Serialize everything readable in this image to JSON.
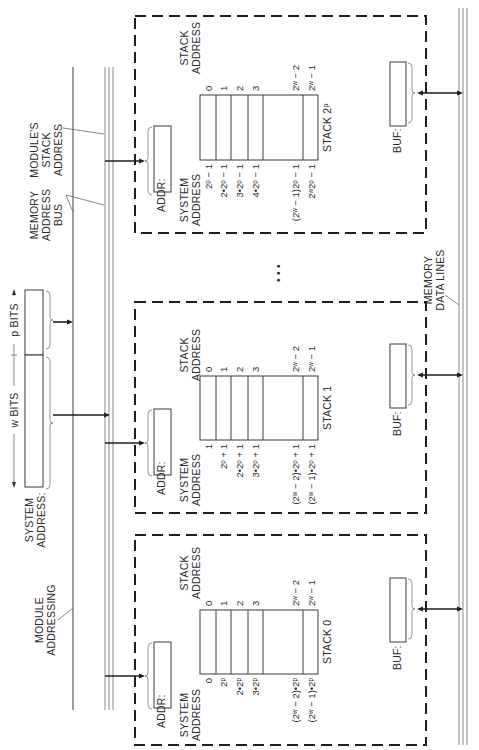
{
  "figure": {
    "orientation": "rotated 90 degrees counter-clockwise",
    "labels": {
      "module_addressing": [
        "MODULE",
        "ADDRESSING"
      ],
      "system_address": [
        "SYSTEM",
        "ADDRESS:"
      ],
      "w_bits": "w BITS",
      "p_bits": "p BITS",
      "memory_address_bus": [
        "MEMORY",
        "ADDRESS",
        "BUS"
      ],
      "modules_stack_address": [
        "MODULE'S",
        "STACK",
        "ADDRESS"
      ],
      "memory_data_lines": [
        "MEMORY",
        "DATA LINES"
      ],
      "ellipsis": "• • •"
    },
    "modules": [
      {
        "name": "STACK 0",
        "addr_label": "ADDR:",
        "buf_label": "BUF:",
        "system_address_heading": [
          "SYSTEM",
          "ADDRESS"
        ],
        "stack_address_heading": [
          "STACK",
          "ADDRESS"
        ],
        "stack_addresses": [
          "0",
          "1",
          "2",
          "3",
          "2ʷ − 2",
          "2ʷ − 1"
        ],
        "system_addresses": [
          "0",
          "2ᵖ",
          "2•2ᵖ",
          "3•2ᵖ",
          "(2ʷ − 2)•2ᵖ",
          "(2ʷ − 1)•2ᵖ"
        ]
      },
      {
        "name": "STACK 1",
        "addr_label": "ADDR:",
        "buf_label": "BUF:",
        "system_address_heading": [
          "SYSTEM",
          "ADDRESS"
        ],
        "stack_address_heading": [
          "STACK",
          "ADDRESS"
        ],
        "stack_addresses": [
          "0",
          "1",
          "2",
          "3",
          "2ʷ − 2",
          "2ʷ − 1"
        ],
        "system_addresses": [
          "1",
          "2ᵖ + 1",
          "2•2ᵖ + 1",
          "3•2ᵖ + 1",
          "(2ʷ − 2)•2ᵖ + 1",
          "(2ʷ − 1)•2ᵖ + 1"
        ]
      },
      {
        "name": "STACK 2ᵖ",
        "addr_label": "ADDR:",
        "buf_label": "BUF:",
        "system_address_heading": [
          "SYSTEM",
          "ADDRESS"
        ],
        "stack_address_heading": [
          "STACK",
          "ADDRESS"
        ],
        "stack_addresses": [
          "0",
          "1",
          "2",
          "3",
          "2ʷ − 2",
          "2ʷ − 1"
        ],
        "system_addresses": [
          "2ᵖ − 1",
          "2•2ᵖ − 1",
          "3•2ᵖ − 1",
          "4•2ᵖ − 1",
          "(2ʷ − 1)2ᵖ − 1",
          "2ʷ2ᵖ − 1"
        ]
      }
    ]
  }
}
